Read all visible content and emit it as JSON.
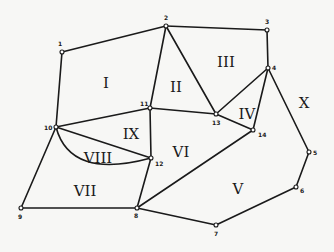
{
  "diagram": {
    "nodes": [
      {
        "id": "1",
        "x": 62,
        "y": 52,
        "lx": 58,
        "ly": 46
      },
      {
        "id": "2",
        "x": 166,
        "y": 26,
        "lx": 164,
        "ly": 20
      },
      {
        "id": "3",
        "x": 267,
        "y": 30,
        "lx": 265,
        "ly": 24
      },
      {
        "id": "4",
        "x": 268,
        "y": 68,
        "lx": 272,
        "ly": 70
      },
      {
        "id": "5",
        "x": 309,
        "y": 152,
        "lx": 313,
        "ly": 155
      },
      {
        "id": "6",
        "x": 296,
        "y": 187,
        "lx": 300,
        "ly": 193
      },
      {
        "id": "7",
        "x": 216,
        "y": 225,
        "lx": 214,
        "ly": 236
      },
      {
        "id": "8",
        "x": 137,
        "y": 208,
        "lx": 134,
        "ly": 218
      },
      {
        "id": "9",
        "x": 21,
        "y": 208,
        "lx": 18,
        "ly": 219
      },
      {
        "id": "10",
        "x": 56,
        "y": 127,
        "lx": 44,
        "ly": 130
      },
      {
        "id": "11",
        "x": 150,
        "y": 108,
        "lx": 140,
        "ly": 106
      },
      {
        "id": "12",
        "x": 151,
        "y": 158,
        "lx": 155,
        "ly": 166
      },
      {
        "id": "13",
        "x": 216,
        "y": 114,
        "lx": 212,
        "ly": 125
      },
      {
        "id": "14",
        "x": 253,
        "y": 130,
        "lx": 258,
        "ly": 137
      }
    ],
    "edges": [
      [
        "1",
        "2"
      ],
      [
        "2",
        "3"
      ],
      [
        "3",
        "4"
      ],
      [
        "1",
        "10"
      ],
      [
        "2",
        "11"
      ],
      [
        "2",
        "13"
      ],
      [
        "10",
        "11"
      ],
      [
        "11",
        "13"
      ],
      [
        "11",
        "12"
      ],
      [
        "10",
        "12"
      ],
      [
        "13",
        "4"
      ],
      [
        "13",
        "14"
      ],
      [
        "4",
        "14"
      ],
      [
        "4",
        "5"
      ],
      [
        "5",
        "6"
      ],
      [
        "6",
        "7"
      ],
      [
        "7",
        "8"
      ],
      [
        "8",
        "14"
      ],
      [
        "8",
        "12"
      ],
      [
        "8",
        "9"
      ],
      [
        "9",
        "10"
      ]
    ],
    "arc": {
      "from": "10",
      "to": "12",
      "path": "M56,127 Q70,180 151,158"
    },
    "regions": [
      {
        "label": "I",
        "x": 106,
        "y": 84
      },
      {
        "label": "II",
        "x": 176,
        "y": 88
      },
      {
        "label": "III",
        "x": 226,
        "y": 63
      },
      {
        "label": "IV",
        "x": 247,
        "y": 115
      },
      {
        "label": "V",
        "x": 238,
        "y": 190
      },
      {
        "label": "VI",
        "x": 181,
        "y": 153
      },
      {
        "label": "VII",
        "x": 85,
        "y": 192
      },
      {
        "label": "VIII",
        "x": 98,
        "y": 159
      },
      {
        "label": "IX",
        "x": 131,
        "y": 135
      },
      {
        "label": "X",
        "x": 304,
        "y": 104
      }
    ]
  }
}
